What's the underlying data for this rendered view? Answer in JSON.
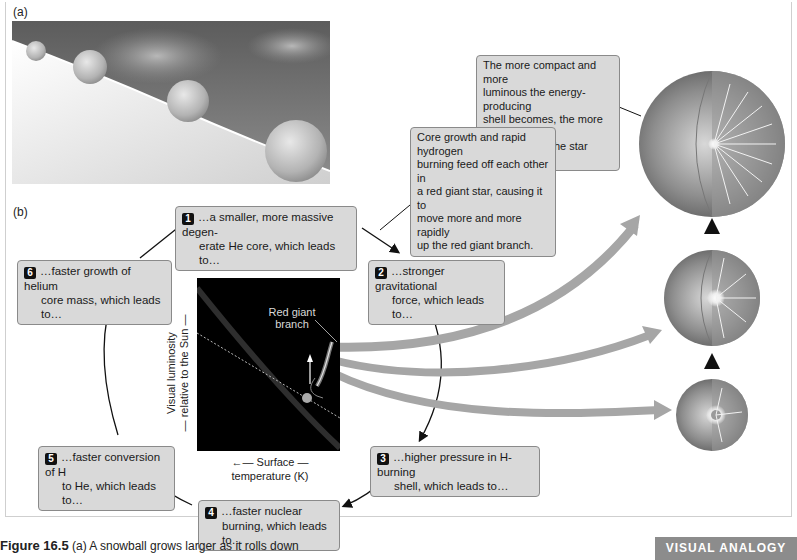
{
  "panel_a": {
    "label": "(a)",
    "illustration": "snowballs-rolling-downhill-growing-larger"
  },
  "panel_b": {
    "label": "(b)"
  },
  "callouts": {
    "shell": "The more compact and more luminous the energy-producing shell becomes, the more the outer parts of the star swell.",
    "shell_lines": [
      "The more compact and more",
      "luminous the energy-producing",
      "shell becomes, the more the",
      "outer parts of the star swell."
    ],
    "core_growth": "Core growth and rapid hydrogen burning feed off each other in a red giant star, causing it to move more and more rapidly up the red giant branch.",
    "core_growth_lines": [
      "Core growth and rapid hydrogen",
      "burning feed off each other in",
      "a red giant star, causing it to",
      "move more and more rapidly",
      "up the red giant branch."
    ]
  },
  "cycle_steps": [
    {
      "num": "1",
      "line1": "…a smaller, more massive degen-",
      "line2": "erate He core, which leads to…"
    },
    {
      "num": "2",
      "line1": "…stronger gravitational",
      "line2": "force, which leads to…"
    },
    {
      "num": "3",
      "line1": "…higher pressure in H-burning",
      "line2": "shell, which leads to…"
    },
    {
      "num": "4",
      "line1": "…faster nuclear",
      "line2": "burning, which leads to…"
    },
    {
      "num": "5",
      "line1": "…faster conversion of H",
      "line2": "to He, which leads to…"
    },
    {
      "num": "6",
      "line1": "…faster growth of helium",
      "line2": "core mass, which leads to…"
    }
  ],
  "hr_diagram": {
    "branch_label_line1": "Red giant",
    "branch_label_line2": "branch",
    "y_axis_line1": "Visual luminosity",
    "y_axis_line2": "— relative to the Sun —",
    "x_axis_line1": "←— Surface —",
    "x_axis_line2": "temperature (K)"
  },
  "stars": [
    {
      "name": "large-red-giant",
      "size": "large"
    },
    {
      "name": "medium-red-giant",
      "size": "medium"
    },
    {
      "name": "small-red-giant",
      "size": "small"
    }
  ],
  "caption": {
    "figure_number": "Figure 16.5",
    "text": "(a) A snowball grows larger as it rolls down"
  },
  "badge": "VISUAL ANALOGY",
  "colors": {
    "box_fill": "#d9d9d9",
    "box_border": "#8a8a8a",
    "arrow_gray": "#a6a6a6",
    "plot_bg": "#000000",
    "badge_bg": "#8c8c8c"
  }
}
